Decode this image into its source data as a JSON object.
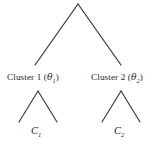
{
  "diagram": {
    "type": "hierarchical-cluster-tree",
    "background_color": "#ffffff",
    "line_color": "#3a3a3a",
    "text_color": "#272727",
    "root": {
      "name": "root-node",
      "apex": [
        78,
        4
      ]
    },
    "branches": {
      "top_left_end": [
        35,
        65
      ],
      "top_right_end": [
        121,
        65
      ],
      "left_subtree_apex": [
        38,
        91
      ],
      "left_subtree_left_end": [
        19,
        122
      ],
      "left_subtree_right_end": [
        57,
        122
      ],
      "right_subtree_apex": [
        121,
        91
      ],
      "right_subtree_left_end": [
        102,
        122
      ],
      "right_subtree_right_end": [
        140,
        122
      ]
    },
    "clusters": [
      {
        "id": "cluster-1",
        "label_prefix": "Cluster 1 (",
        "greek_symbol": "θ",
        "subscript": "1",
        "label_suffix": ")",
        "full_label": "Cluster 1 (θ1)"
      },
      {
        "id": "cluster-2",
        "label_prefix": "Cluster 2 (",
        "greek_symbol": "θ",
        "subscript": "2",
        "label_suffix": ")",
        "full_label": "Cluster 2 (θ2)"
      }
    ],
    "leaves": [
      {
        "id": "leaf-1",
        "symbol": "C",
        "subscript": "1",
        "full_label": "C1"
      },
      {
        "id": "leaf-2",
        "symbol": "C",
        "subscript": "2",
        "full_label": "C2"
      }
    ]
  }
}
